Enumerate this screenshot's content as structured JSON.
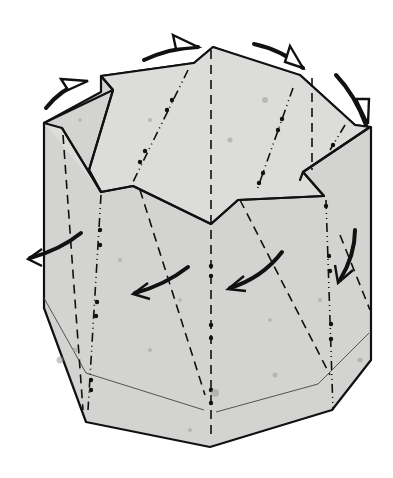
{
  "figure": {
    "type": "origami-diagram",
    "colors": {
      "paper": "#d3d3d1",
      "line": "#111111",
      "background": "#ffffff"
    },
    "symbols": {
      "valley_fold": "dashed line",
      "mountain_fold": "dash-dot-dot line",
      "push_arrows": 5,
      "rotation_arrows": 4
    }
  }
}
